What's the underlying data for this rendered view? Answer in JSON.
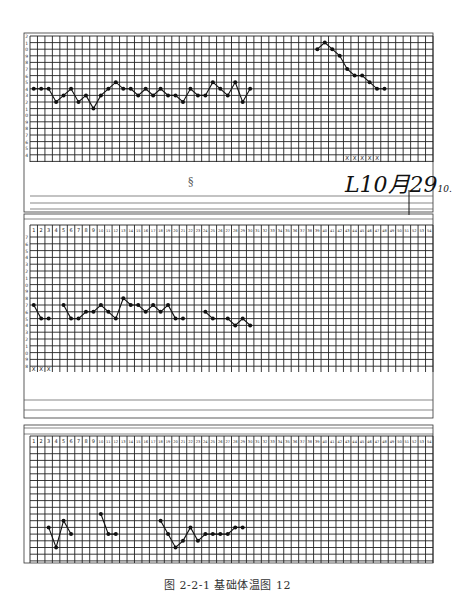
{
  "caption": "图 2-2-1   基础体温图 12",
  "annotation_date": "L10月29",
  "annotation_suffix": "10.",
  "chart_data": [
    {
      "type": "line",
      "title": "Basal body temperature chart – panel 1",
      "xlabel": "Cycle day",
      "ylabel": "Temperature (°C)",
      "x_range": [
        1,
        54
      ],
      "y_ticks": [
        "37.2",
        "37.1",
        "37.0",
        "36.9",
        "36.8",
        "36.7",
        "36.6",
        "36.5",
        "36.4",
        "36.3",
        "36.2",
        "36.1",
        "36.0",
        "35.9",
        "35.8",
        "35.7",
        "35.6",
        "35.5",
        "35.4"
      ],
      "grid": true,
      "series": [
        {
          "name": "BBT segment A",
          "x": [
            1,
            2,
            3,
            4,
            5,
            6,
            7,
            8,
            9,
            10,
            11,
            12,
            13,
            14,
            15,
            16,
            17,
            18,
            19,
            20,
            21,
            22,
            23,
            24,
            25,
            26,
            27,
            28,
            29,
            30
          ],
          "y": [
            36.4,
            36.4,
            36.4,
            36.2,
            36.3,
            36.4,
            36.2,
            36.3,
            36.1,
            36.3,
            36.4,
            36.5,
            36.4,
            36.4,
            36.3,
            36.4,
            36.3,
            36.4,
            36.3,
            36.3,
            36.2,
            36.4,
            36.3,
            36.3,
            36.5,
            36.4,
            36.3,
            36.5,
            36.2,
            36.4
          ]
        },
        {
          "name": "BBT segment B",
          "x": [
            39,
            40,
            41,
            42,
            43,
            44,
            45,
            46,
            47,
            48
          ],
          "y": [
            37.0,
            37.1,
            37.0,
            36.9,
            36.7,
            36.6,
            36.6,
            36.5,
            36.4,
            36.4
          ]
        }
      ],
      "markers": {
        "label": "X",
        "days": [
          43,
          44,
          45,
          46,
          47
        ],
        "meaning": "menstruation"
      },
      "annotations": [
        "L10月29 10."
      ]
    },
    {
      "type": "line",
      "title": "Basal body temperature chart – panel 2",
      "xlabel": "Cycle day",
      "ylabel": "Temperature (°C)",
      "x_range": [
        1,
        54
      ],
      "day_labels": [
        "1",
        "2",
        "3",
        "4",
        "5",
        "6",
        "7",
        "8",
        "9",
        "10",
        "11",
        "12",
        "13",
        "14",
        "15",
        "16",
        "17",
        "18",
        "19",
        "20",
        "21",
        "22",
        "23",
        "24",
        "25",
        "26",
        "27",
        "28",
        "29",
        "30",
        "31",
        "32",
        "33",
        "34",
        "35",
        "36",
        "37",
        "38",
        "39",
        "40",
        "41",
        "42",
        "43",
        "44",
        "45",
        "46",
        "47",
        "48",
        "49",
        "50",
        "51",
        "52",
        "53",
        "54"
      ],
      "grid": true,
      "series": [
        {
          "name": "BBT segment A",
          "x": [
            1,
            2,
            3
          ],
          "y": [
            36.5,
            36.3,
            36.3
          ]
        },
        {
          "name": "BBT segment B",
          "x": [
            5,
            6,
            7,
            8,
            9,
            10,
            11,
            12,
            13,
            14,
            15,
            16,
            17,
            18,
            19,
            20,
            21
          ],
          "y": [
            36.5,
            36.3,
            36.3,
            36.4,
            36.4,
            36.5,
            36.4,
            36.3,
            36.6,
            36.5,
            36.5,
            36.4,
            36.5,
            36.4,
            36.5,
            36.3,
            36.3
          ]
        },
        {
          "name": "BBT segment C",
          "x": [
            24,
            25,
            27,
            28,
            29,
            30
          ],
          "y": [
            36.4,
            36.3,
            36.3,
            36.2,
            36.3,
            36.2
          ]
        }
      ],
      "markers": {
        "label": "X",
        "days": [
          1,
          2,
          3
        ],
        "meaning": "menstruation"
      }
    },
    {
      "type": "line",
      "title": "Basal body temperature chart – panel 3",
      "xlabel": "Cycle day",
      "ylabel": "Temperature (°C)",
      "x_range": [
        1,
        54
      ],
      "day_labels": [
        "1",
        "2",
        "3",
        "4",
        "5",
        "6",
        "7",
        "8",
        "9",
        "10",
        "11",
        "12",
        "13",
        "14",
        "15",
        "16",
        "17",
        "18",
        "19",
        "20",
        "21",
        "22",
        "23",
        "24",
        "25",
        "26",
        "27",
        "28",
        "29",
        "30",
        "31",
        "32",
        "33",
        "34",
        "35",
        "36",
        "37",
        "38",
        "39",
        "40",
        "41",
        "42",
        "43",
        "44",
        "45",
        "46",
        "47",
        "48",
        "49",
        "50",
        "51",
        "52",
        "53",
        "54"
      ],
      "grid": true,
      "series": [
        {
          "name": "BBT segment A",
          "x": [
            3,
            4,
            5,
            6
          ],
          "y": [
            36.3,
            36.0,
            36.4,
            36.2
          ]
        },
        {
          "name": "BBT segment B",
          "x": [
            10,
            11,
            12
          ],
          "y": [
            36.5,
            36.2,
            36.2
          ]
        },
        {
          "name": "BBT segment C",
          "x": [
            18,
            19,
            20,
            21,
            22,
            23,
            24,
            25,
            26,
            27,
            28,
            29
          ],
          "y": [
            36.4,
            36.2,
            36.0,
            36.1,
            36.3,
            36.1,
            36.2,
            36.2,
            36.2,
            36.2,
            36.3,
            36.3
          ]
        }
      ]
    }
  ]
}
